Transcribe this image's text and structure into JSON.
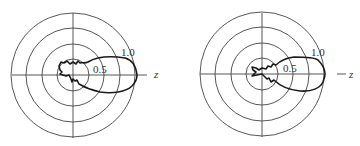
{
  "figure": {
    "background": "#ffffff",
    "line_color": "#444444",
    "pattern_color": "#1a1a1a",
    "plots": [
      {
        "id": "left",
        "center": [
          73,
          75
        ],
        "ring_radii": [
          16,
          31,
          47,
          62
        ],
        "axis_extent": {
          "left": 12,
          "right": 147,
          "top": 13,
          "bottom": 138
        },
        "ring_labels": [
          {
            "text": "0.5",
            "x": 93,
            "y": 73
          },
          {
            "text": "1.0",
            "x": 121,
            "y": 56
          }
        ],
        "axis_label": {
          "text": "z",
          "x": 154,
          "y": 78
        },
        "axis_label_dash": false,
        "lobe_path": "M 137 75 C 136 66, 133 60, 125 58 C 112 56, 98 56, 88 62 C 84 64, 82 62, 80 63 L 78 61 L 76 64 L 73 62 L 70 64 L 67 61 L 64 63 L 61 62 L 59 66 L 60 70 L 62 72 L 60 74 L 63 75 L 66 76 L 69 75 L 71 79 L 72 82 L 73 79 L 75 81 L 77 80 L 79 84 L 81 85 C 86 88, 92 90, 100 92 C 112 94, 126 92, 132 86 C 136 82, 137 79, 137 75 Z"
      },
      {
        "id": "right",
        "center": [
          262,
          74
        ],
        "ring_radii": [
          16,
          31,
          47,
          62
        ],
        "axis_extent": {
          "left": 200,
          "right": 324,
          "top": 13,
          "bottom": 137
        },
        "ring_labels": [
          {
            "text": "0.5",
            "x": 283,
            "y": 72
          },
          {
            "text": "1.0",
            "x": 311,
            "y": 56
          }
        ],
        "axis_label": {
          "text": "z",
          "x": 349,
          "y": 78
        },
        "axis_label_dash": true,
        "lobe_path": "M 325 74 C 325 68, 322 64, 318 60 C 314 57, 304 57, 294 57 C 286 58, 280 61, 276 65 L 273 64 L 271 67 L 268 66 L 266 69 L 262 68 L 259 70 L 256 68 L 252 67 L 253 70 L 256 72 L 254 74 L 252 76 L 257 75 L 262 74 L 265 77 L 267 79 L 269 78 L 271 82 L 274 80 C 280 86, 290 90, 300 91 C 312 92, 320 88, 323 82 C 324 79, 325 77, 325 74 Z"
      }
    ]
  }
}
